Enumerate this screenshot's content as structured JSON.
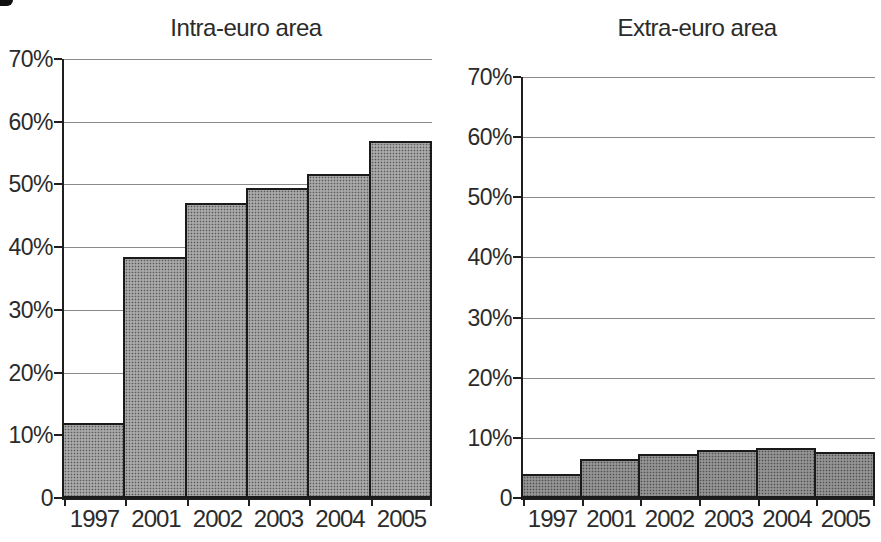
{
  "figure": {
    "background": "#ffffff",
    "text_color": "#2b2b2b",
    "axis_color": "#1f1f1f",
    "gridline_color": "#8a8a8a",
    "bar_border_color": "#1a1a1a"
  },
  "chart_data": [
    {
      "type": "bar",
      "title": "Intra-euro area",
      "categories": [
        "1997",
        "2001",
        "2002",
        "2003",
        "2004",
        "2005"
      ],
      "values": [
        12,
        38.5,
        47,
        49.5,
        51.7,
        57
      ],
      "ylim": [
        0,
        70
      ],
      "ytick_labels": [
        "70%",
        "60%",
        "50%",
        "40%",
        "30%",
        "20%",
        "10%",
        "0"
      ],
      "grid": true,
      "legend": "none",
      "bar_fill": "#a9a9a9"
    },
    {
      "type": "bar",
      "title": "Extra-euro area",
      "categories": [
        "1997",
        "2001",
        "2002",
        "2003",
        "2004",
        "2005"
      ],
      "values": [
        4,
        6.5,
        7.3,
        8,
        8.3,
        7.6
      ],
      "ylim": [
        0,
        70
      ],
      "ytick_labels": [
        "70%",
        "60%",
        "50%",
        "40%",
        "30%",
        "20%",
        "10%",
        "0"
      ],
      "grid": true,
      "legend": "none",
      "bar_fill": "#949494"
    }
  ]
}
